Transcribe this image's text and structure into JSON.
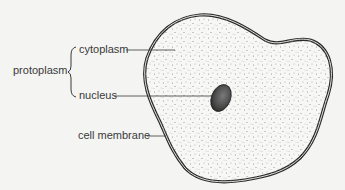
{
  "diagram": {
    "labels": {
      "protoplasm": "protoplasm",
      "cytoplasm": "cytoplasm",
      "nucleus": "nucleus",
      "cell_membrane": "cell membrane"
    },
    "colors": {
      "background": "#f4f4f2",
      "outline": "#2a2a2a",
      "text": "#3a3a3a",
      "stipple": "#8a8a8a",
      "nucleus": "#3c3c3c"
    }
  }
}
